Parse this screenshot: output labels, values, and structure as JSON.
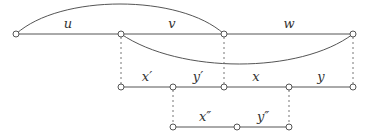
{
  "diagram": {
    "rows": [
      {
        "id": "top",
        "labels": [
          "u",
          "v",
          "w"
        ]
      },
      {
        "id": "middle",
        "labels": [
          "x′",
          "y′",
          "x",
          "y"
        ]
      },
      {
        "id": "bottom",
        "labels": [
          "x″",
          "y″"
        ]
      }
    ],
    "arcs": [
      {
        "from": "top-node-0",
        "to": "top-node-2",
        "direction": "over"
      },
      {
        "from": "top-node-1",
        "to": "top-node-3",
        "direction": "under"
      }
    ],
    "colors": {
      "line": "#555555",
      "dashed": "#777777",
      "node_fill": "#ffffff",
      "text": "#333333"
    }
  }
}
